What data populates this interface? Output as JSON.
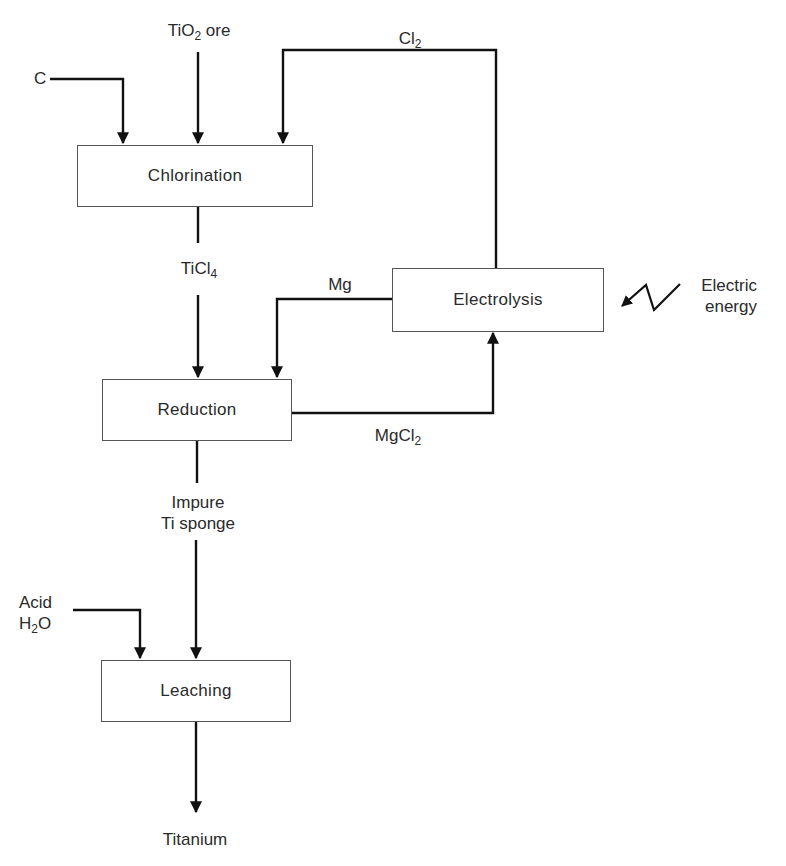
{
  "diagram": {
    "type": "process-flow",
    "stages": {
      "chlorination": "Chlorination",
      "electrolysis": "Electrolysis",
      "reduction": "Reduction",
      "leaching": "Leaching"
    },
    "streams": {
      "carbon": "C",
      "tio2_main": "TiO",
      "tio2_sub": "2",
      "tio2_rest": " ore",
      "cl2_main": "Cl",
      "cl2_sub": "2",
      "ticl4_main": "TiCl",
      "ticl4_sub": "4",
      "mg": "Mg",
      "mgcl2_main": "MgCl",
      "mgcl2_sub": "2",
      "sponge_line1": "Impure",
      "sponge_line2": "Ti sponge",
      "acid_line1": "Acid",
      "water_main": "H",
      "water_sub": "2",
      "water_rest": "O",
      "electric_line1": "Electric",
      "electric_line2": "energy",
      "product": "Titanium"
    },
    "edges": [
      {
        "from": "C",
        "to": "Chlorination"
      },
      {
        "from": "TiO2 ore",
        "to": "Chlorination"
      },
      {
        "from": "Electrolysis",
        "to": "Chlorination",
        "label": "Cl2"
      },
      {
        "from": "Chlorination",
        "to": "Reduction",
        "label": "TiCl4"
      },
      {
        "from": "Electrolysis",
        "to": "Reduction",
        "label": "Mg"
      },
      {
        "from": "Reduction",
        "to": "Electrolysis",
        "label": "MgCl2"
      },
      {
        "from": "Electric energy",
        "to": "Electrolysis"
      },
      {
        "from": "Reduction",
        "to": "Leaching",
        "label": "Impure Ti sponge"
      },
      {
        "from": "Acid H2O",
        "to": "Leaching"
      },
      {
        "from": "Leaching",
        "to": "Titanium"
      }
    ],
    "colors": {
      "line": "#111111",
      "box_border": "#555555",
      "text": "#2a2a2a"
    }
  }
}
